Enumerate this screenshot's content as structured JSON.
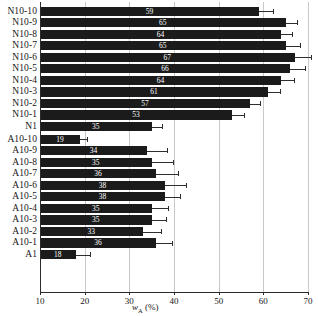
{
  "chart_data": {
    "type": "bar",
    "orientation": "horizontal",
    "title": "",
    "xlabel": "wA (%)",
    "xlabel_parts": {
      "symbol": "w",
      "subscript": "A",
      "unit": "(%)"
    },
    "ylabel": "",
    "xlim": [
      10,
      70
    ],
    "xticks": [
      10,
      20,
      30,
      40,
      50,
      60,
      70
    ],
    "xtick_labels": [
      "10",
      "20",
      "30",
      "40",
      "50",
      "60",
      "70"
    ],
    "grid": "vertical",
    "legend": "none",
    "bar_color": "#1b1b1b",
    "value_label_color": "#ffffff",
    "groups": [
      {
        "name": "N-series",
        "categories": [
          "N10-10",
          "N10-9",
          "N10-8",
          "N10-7",
          "N10-6",
          "N10-5",
          "N10-4",
          "N10-3",
          "N10-2",
          "N10-1",
          "N1"
        ],
        "values": [
          59,
          65,
          64,
          65,
          67,
          66,
          64,
          61,
          57,
          53,
          35
        ],
        "errors": [
          3.1,
          2.6,
          2.4,
          3.2,
          3.6,
          3.3,
          2.8,
          2.7,
          2.3,
          2.6,
          2.4
        ]
      },
      {
        "name": "A-series",
        "categories": [
          "A10-10",
          "A10-9",
          "A10-8",
          "A10-7",
          "A10-6",
          "A10-5",
          "A10-4",
          "A10-3",
          "A10-2",
          "A10-1",
          "A1"
        ],
        "values": [
          19,
          34,
          35,
          36,
          38,
          38,
          35,
          35,
          33,
          36,
          18
        ],
        "errors": [
          1.6,
          4.4,
          4.7,
          4.8,
          4.6,
          3.4,
          3.6,
          3.1,
          4.1,
          3.6,
          3.3
        ]
      }
    ]
  }
}
